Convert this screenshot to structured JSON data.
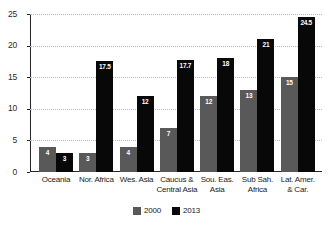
{
  "chart_data": {
    "type": "bar",
    "title": "",
    "subtitle": "",
    "xlabel": "",
    "ylabel": "",
    "ylim": [
      0,
      25
    ],
    "yticks": [
      0,
      5,
      10,
      15,
      20,
      25
    ],
    "grid": true,
    "legend_position": "bottom-center",
    "categories": [
      "Oceania",
      "Nor. Africa",
      "Wes. Asia",
      "Caucus & Central Asia",
      "Sou. Eas. Asia",
      "Sub Sah. Africa",
      "Lat. Amer. & Car."
    ],
    "category_lines": [
      [
        "Oceania"
      ],
      [
        "Nor. Africa"
      ],
      [
        "Wes. Asia"
      ],
      [
        "Caucus &",
        "Central Asia"
      ],
      [
        "Sou. Eas.",
        "Asia"
      ],
      [
        "Sub Sah.",
        "Africa"
      ],
      [
        "Lat. Amer.",
        "& Car."
      ]
    ],
    "series": [
      {
        "name": "2000",
        "color": "#595959",
        "values": [
          4,
          3,
          4,
          7,
          12,
          13,
          15
        ],
        "labels": [
          "4",
          "3",
          "4",
          "7",
          "12",
          "13",
          "15"
        ]
      },
      {
        "name": "2013",
        "color": "#080808",
        "values": [
          3,
          17.5,
          12,
          17.7,
          18,
          21,
          24.5
        ],
        "labels": [
          "3",
          "17.5",
          "12",
          "17.7",
          "18",
          "21",
          "24.5"
        ]
      }
    ]
  },
  "legend": {
    "items": [
      {
        "label": "2000",
        "color": "#595959"
      },
      {
        "label": "2013",
        "color": "#080808"
      }
    ]
  },
  "axis": {
    "y_tick_labels": [
      "25",
      "20",
      "15",
      "10",
      "5",
      "0"
    ]
  }
}
